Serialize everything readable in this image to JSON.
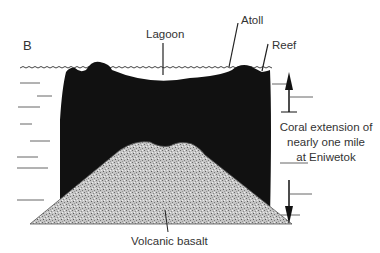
{
  "figure": {
    "panel_label": "B",
    "labels": {
      "lagoon": "Lagoon",
      "atoll": "Atoll",
      "reef": "Reef",
      "volcanic_basalt": "Volcanic basalt"
    },
    "annotation": {
      "line1": "Coral extension of",
      "line2": "nearly one mile",
      "line3": "at Eniwetok"
    },
    "colors": {
      "coral": "#111111",
      "basalt": "#b8b8b8",
      "water_lines": "#555555",
      "text": "#333333",
      "background": "#ffffff"
    }
  }
}
